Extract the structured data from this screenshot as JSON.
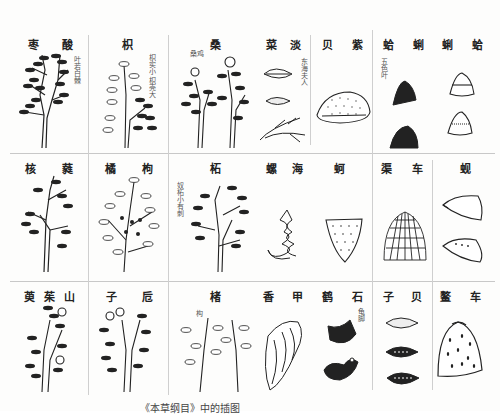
{
  "page": {
    "caption": "《本草纲目》中的插图"
  },
  "rows": [
    {
      "cells": [
        {
          "id": "suanzao",
          "labels": [
            "枣",
            "酸"
          ],
          "note": "叶若白棘",
          "kind": "plant"
        },
        {
          "id": "zhiju",
          "labels": [
            "枳"
          ],
          "note": "枳实小 枳壳大",
          "kind": "plant"
        },
        {
          "id": "sang",
          "labels": [
            "桑"
          ],
          "note": "桑鸡",
          "kind": "plant"
        },
        {
          "id": "danlai",
          "labels": [
            "菜",
            "淡"
          ],
          "note": "东海夫人",
          "kind": "shell"
        },
        {
          "id": "zibei",
          "labels": [
            "贝",
            "紫"
          ],
          "note": "",
          "kind": "shell"
        },
        {
          "id": "geli",
          "labels": [
            "蛤",
            "蜊"
          ],
          "note": "五色叶",
          "kind": "shell"
        },
        {
          "id": "ge",
          "labels": [
            "蜊",
            "蛤"
          ],
          "note": "",
          "kind": "shell"
        }
      ]
    },
    {
      "cells": [
        {
          "id": "heirui",
          "labels": [
            "核",
            "蕤"
          ],
          "note": "",
          "kind": "plant"
        },
        {
          "id": "gouju",
          "labels": [
            "橘",
            "枸"
          ],
          "note": "",
          "kind": "plant"
        },
        {
          "id": "zhe",
          "labels": [
            "柘"
          ],
          "note": "奴柘小有刺",
          "kind": "plant"
        },
        {
          "id": "haiying",
          "labels": [
            "螺",
            "海"
          ],
          "note": "",
          "kind": "shell"
        },
        {
          "id": "he",
          "labels": [
            "蚵"
          ],
          "note": "",
          "kind": "shell"
        },
        {
          "id": "chequ",
          "labels": [
            "车",
            "渠"
          ],
          "note": "",
          "kind": "shell"
        },
        {
          "id": "xian",
          "labels": [
            "蚬"
          ],
          "note": "",
          "kind": "shell"
        }
      ]
    },
    {
      "cells": [
        {
          "id": "shanzhuyu",
          "labels": [
            "萸",
            "茱",
            "山"
          ],
          "note": "",
          "kind": "plant"
        },
        {
          "id": "zhizi",
          "labels": [
            "子",
            "卮"
          ],
          "note": "",
          "kind": "plant"
        },
        {
          "id": "chu",
          "labels": [
            "楮"
          ],
          "note": "构",
          "kind": "plant"
        },
        {
          "id": "jiaxiang",
          "labels": [
            "香",
            "甲"
          ],
          "note": "",
          "kind": "shell"
        },
        {
          "id": "shijie",
          "labels": [
            "鹤",
            "石"
          ],
          "note": "龟脚",
          "kind": "shell"
        },
        {
          "id": "beizi",
          "labels": [
            "子",
            "贝"
          ],
          "note": "",
          "kind": "shell"
        },
        {
          "id": "aoche",
          "labels": [
            "鳌",
            "车"
          ],
          "note": "",
          "kind": "shell"
        }
      ]
    }
  ]
}
